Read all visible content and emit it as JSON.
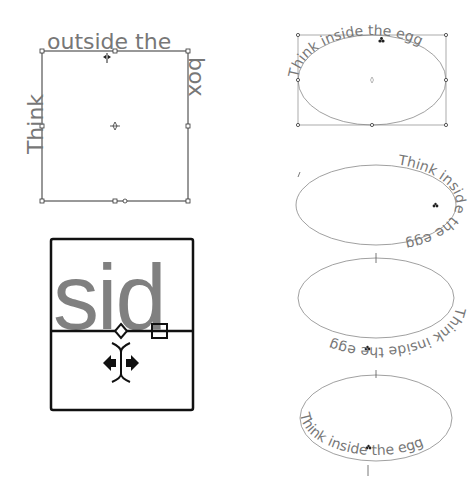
{
  "colors": {
    "text_gray": "#777777",
    "stroke_dark": "#333333",
    "stroke_light": "#888888",
    "zoom_frame": "#111111",
    "background": "#ffffff"
  },
  "figures": {
    "square_path_text": {
      "text_left": "Think",
      "text_top": "outside the",
      "text_right": "box",
      "full_text": "Think outside the box"
    },
    "zoom_detail": {
      "glyphs": "sid"
    },
    "ellipse_1": {
      "text": "Think inside the egg",
      "placement": "top"
    },
    "ellipse_2": {
      "text": "Think inside the egg",
      "placement": "right"
    },
    "ellipse_3": {
      "text": "Think inside the egg",
      "placement": "bottom-flipped"
    },
    "ellipse_4": {
      "text": "Think inside the egg",
      "placement": "bottom"
    }
  }
}
